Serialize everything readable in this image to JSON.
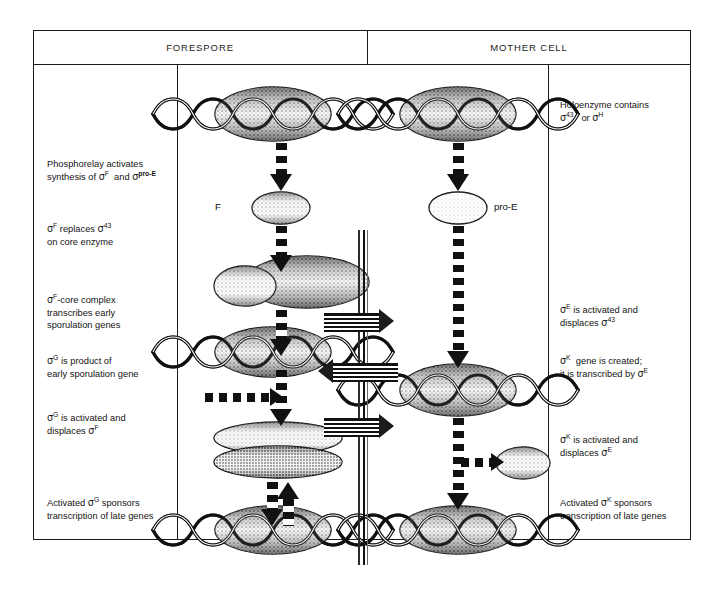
{
  "figure": {
    "headers": [
      {
        "label": "FORESPORE"
      },
      {
        "label": "MOTHER CELL"
      }
    ],
    "left_notes": [
      {
        "id": "note-phosphorelay",
        "lines": [
          "Phosphorelay  activates",
          "synthesis of σF  and σpro-E"
        ]
      },
      {
        "id": "note-sigma-f-replaces",
        "lines": [
          "σF  replaces σ43",
          "on core enzyme"
        ]
      },
      {
        "id": "note-sigma-f-core",
        "lines": [
          "σF -core complex",
          "transcribes  early",
          "sporulation genes"
        ]
      },
      {
        "id": "note-sigma-g-product",
        "lines": [
          "σG  is product of",
          "early sporulation gene"
        ]
      },
      {
        "id": "note-sigma-g-activated",
        "lines": [
          "σG  is activated and",
          "displaces σF"
        ]
      },
      {
        "id": "note-sigma-g-sponsors",
        "lines": [
          "Activated σG  sponsors",
          "transcription of late genes"
        ]
      }
    ],
    "right_notes": [
      {
        "id": "note-holoenzyme",
        "lines": [
          "Holoenzyme contains",
          "σ43   or σH"
        ]
      },
      {
        "id": "note-sigma-e-activated",
        "lines": [
          "σE  is activated and",
          "displaces σ43"
        ]
      },
      {
        "id": "note-sigma-k-gene",
        "lines": [
          "σK  gene is created;",
          "it is transcribed by σE"
        ]
      },
      {
        "id": "note-sigma-k-activated",
        "lines": [
          "σK  is activated and",
          "displaces σE"
        ]
      },
      {
        "id": "note-sigma-k-sponsors",
        "lines": [
          "Activated σK  sponsors",
          "transcription of late genes"
        ]
      }
    ],
    "diagram_labels": [
      {
        "id": "label-f",
        "text": "F"
      },
      {
        "id": "label-pro-e",
        "text": "pro-E"
      }
    ],
    "colors": {
      "ink": "#111111",
      "rule": "#1a1a1a",
      "paper": "#ffffff",
      "septum": "#2b2b2b"
    }
  }
}
